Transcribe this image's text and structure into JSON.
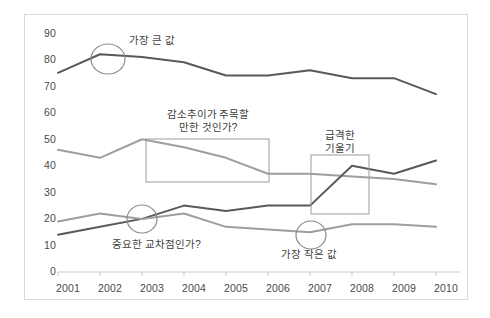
{
  "chart_data": {
    "type": "line",
    "title": "",
    "xlabel": "",
    "ylabel": "",
    "ylim": [
      0,
      90
    ],
    "yticks": [
      0,
      10,
      20,
      30,
      40,
      50,
      60,
      70,
      80,
      90
    ],
    "grid": false,
    "legend": "none",
    "categories": [
      "2001",
      "2002",
      "2003",
      "2004",
      "2005",
      "2006",
      "2007",
      "2008",
      "2009",
      "2010"
    ],
    "series": [
      {
        "name": "series-top-dark",
        "color": "#595959",
        "values": [
          75,
          82,
          81,
          79,
          74,
          74,
          76,
          73,
          73,
          67
        ]
      },
      {
        "name": "series-middle-gray",
        "color": "#9e9e9e",
        "values": [
          46,
          43,
          50,
          47,
          43,
          37,
          37,
          36,
          35,
          33
        ]
      },
      {
        "name": "series-lower-dark",
        "color": "#595959",
        "values": [
          14,
          17,
          20,
          25,
          23,
          25,
          25,
          40,
          37,
          42
        ]
      },
      {
        "name": "series-lower-gray",
        "color": "#9e9e9e",
        "values": [
          19,
          22,
          20,
          22,
          17,
          16,
          15,
          18,
          18,
          17
        ]
      }
    ],
    "annotations": [
      {
        "name": "max-value",
        "text": "가장 큰 값",
        "marker": "circle",
        "at_category": "2002"
      },
      {
        "name": "decline-trend-question",
        "text_line1": "감소추이가 주목할",
        "text_line2": "만한 것인가?",
        "marker": "rectangle",
        "range": [
          "2003",
          "2005"
        ]
      },
      {
        "name": "steep-slope",
        "text_line1": "급격한",
        "text_line2": "기울기",
        "marker": "rectangle",
        "range": [
          "2007",
          "2008"
        ]
      },
      {
        "name": "crossover-question",
        "text": "중요한 교차점인가?",
        "marker": "circle",
        "at_category": "2003"
      },
      {
        "name": "min-value",
        "text": "가장 작은 값",
        "marker": "circle",
        "at_category": "2007"
      }
    ],
    "colors": {
      "dark_line": "#595959",
      "gray_line": "#9e9e9e",
      "axis": "#bfbfbf",
      "frame": "#d9d9d9",
      "annotation_shape": "#7f7f7f",
      "text": "#404040"
    }
  }
}
